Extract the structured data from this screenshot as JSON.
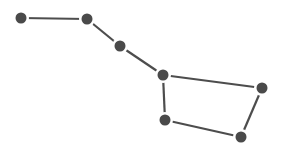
{
  "diagram": {
    "colors": {
      "star": "#4a4a4a",
      "line": "#4d4d4d",
      "background": "#ffffff"
    },
    "stars": [
      {
        "id": "s1",
        "x": 21,
        "y": 18
      },
      {
        "id": "s2",
        "x": 87,
        "y": 19
      },
      {
        "id": "s3",
        "x": 120,
        "y": 46
      },
      {
        "id": "s4",
        "x": 163,
        "y": 75
      },
      {
        "id": "s5",
        "x": 262,
        "y": 88
      },
      {
        "id": "s6",
        "x": 241,
        "y": 137
      },
      {
        "id": "s7",
        "x": 165,
        "y": 120
      }
    ],
    "edges": [
      [
        0,
        1
      ],
      [
        1,
        2
      ],
      [
        2,
        3
      ],
      [
        3,
        4
      ],
      [
        4,
        5
      ],
      [
        5,
        6
      ],
      [
        6,
        3
      ]
    ]
  }
}
